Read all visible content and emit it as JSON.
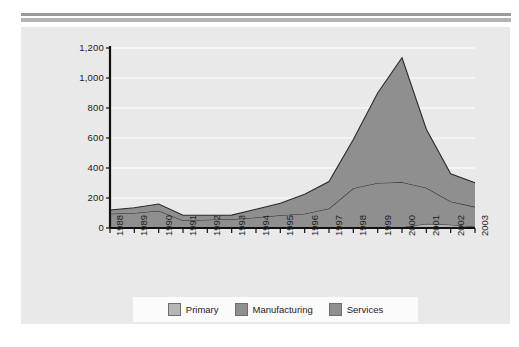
{
  "figure": {
    "panel_background": "#e9e9e9",
    "rule_color": "#9a9a9a"
  },
  "legend": {
    "position": "bottom",
    "items": [
      {
        "label": "Primary",
        "color": "#b6b6b6"
      },
      {
        "label": "Manufacturing",
        "color": "#8f8f8f"
      },
      {
        "label": "Services",
        "color": "#8f8f8f"
      }
    ]
  },
  "chart_data": {
    "type": "area",
    "stacked": true,
    "title": "",
    "xlabel": "",
    "ylabel": "",
    "ylim": [
      0,
      1200
    ],
    "yticks": [
      0,
      200,
      400,
      600,
      800,
      1000,
      1200
    ],
    "ytick_labels": [
      "0",
      "200",
      "400",
      "600",
      "800",
      "1,000",
      "1,200"
    ],
    "grid": true,
    "categories": [
      "1988",
      "1989",
      "1990",
      "1991",
      "1992",
      "1993",
      "1994",
      "1995",
      "1996",
      "1997",
      "1998",
      "1999",
      "2000",
      "2001",
      "2002",
      "2003"
    ],
    "series": [
      {
        "name": "Primary",
        "color": "#b6b6b6",
        "values": [
          0,
          0,
          0,
          0,
          0,
          0,
          0,
          0,
          0,
          0,
          0,
          0,
          5,
          28,
          22,
          8
        ]
      },
      {
        "name": "Manufacturing",
        "color": "#8f8f8f",
        "values": [
          95,
          100,
          115,
          50,
          55,
          58,
          70,
          85,
          95,
          130,
          265,
          300,
          300,
          240,
          155,
          133
        ]
      },
      {
        "name": "Services",
        "color": "#8f8f8f",
        "values": [
          25,
          35,
          45,
          35,
          30,
          28,
          55,
          80,
          130,
          180,
          325,
          600,
          830,
          390,
          185,
          160
        ]
      }
    ],
    "totals": [
      120,
      135,
      160,
      85,
      85,
      86,
      125,
      165,
      225,
      310,
      590,
      900,
      1135,
      658,
      362,
      301
    ],
    "annotations": {
      "peak_year": "2000",
      "peak_value": 1135
    }
  },
  "y_tick_labels": [
    "1,200",
    "1,000",
    "800",
    "600",
    "400",
    "200",
    "0"
  ],
  "x_tick_labels": [
    "1988",
    "1989",
    "1990",
    "1991",
    "1992",
    "1993",
    "1994",
    "1995",
    "1996",
    "1997",
    "1998",
    "1999",
    "2000",
    "2001",
    "2002",
    "2003"
  ]
}
